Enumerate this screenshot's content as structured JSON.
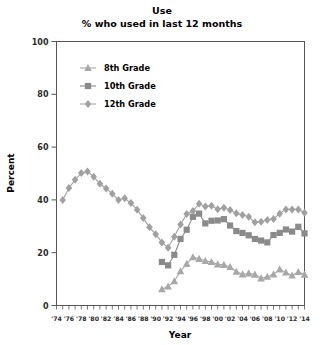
{
  "chart_data": {
    "type": "line",
    "title": "Use",
    "subtitle": "% who used in last 12 months",
    "xlabel": "Year",
    "ylabel": "Percent",
    "ylim": [
      0,
      100
    ],
    "yticks": [
      0,
      20,
      40,
      60,
      80,
      100
    ],
    "xlim": [
      1974,
      2014
    ],
    "xticks_labeled": [
      "'74",
      "'76",
      "'78",
      "'80",
      "'82",
      "'84",
      "'86",
      "'88",
      "'90",
      "'92",
      "'94",
      "'96",
      "'98",
      "'00",
      "'02",
      "'04",
      "'06",
      "'08",
      "'10",
      "'12",
      "'14"
    ],
    "xticks_labeled_values": [
      1974,
      1976,
      1978,
      1980,
      1982,
      1984,
      1986,
      1988,
      1990,
      1992,
      1994,
      1996,
      1998,
      2000,
      2002,
      2004,
      2006,
      2008,
      2010,
      2012,
      2014
    ],
    "grid": false,
    "legend_position": "upper-left-inside",
    "series": [
      {
        "name": "8th Grade",
        "marker": "triangle",
        "color": "#a8a8a8",
        "x": [
          1991,
          1992,
          1993,
          1994,
          1995,
          1996,
          1997,
          1998,
          1999,
          2000,
          2001,
          2002,
          2003,
          2004,
          2005,
          2006,
          2007,
          2008,
          2009,
          2010,
          2011,
          2012,
          2013,
          2014
        ],
        "values": [
          6.2,
          7.2,
          9.2,
          13.0,
          15.8,
          18.3,
          17.7,
          16.9,
          16.5,
          15.6,
          15.4,
          14.6,
          12.8,
          11.8,
          12.2,
          11.7,
          10.3,
          10.9,
          11.8,
          13.7,
          12.5,
          11.4,
          12.7,
          11.7
        ]
      },
      {
        "name": "10th Grade",
        "marker": "square",
        "color": "#8a8a8a",
        "x": [
          1991,
          1992,
          1993,
          1994,
          1995,
          1996,
          1997,
          1998,
          1999,
          2000,
          2001,
          2002,
          2003,
          2004,
          2005,
          2006,
          2007,
          2008,
          2009,
          2010,
          2011,
          2012,
          2013,
          2014
        ],
        "values": [
          16.5,
          15.2,
          19.2,
          25.2,
          28.7,
          33.6,
          34.8,
          31.1,
          32.1,
          32.2,
          32.7,
          30.3,
          28.2,
          27.5,
          26.6,
          25.2,
          24.6,
          23.9,
          26.7,
          27.5,
          28.8,
          28.0,
          29.8,
          27.3
        ]
      },
      {
        "name": "12th Grade",
        "marker": "diamond",
        "color": "#a0a0a0",
        "x": [
          1975,
          1976,
          1977,
          1978,
          1979,
          1980,
          1981,
          1982,
          1983,
          1984,
          1985,
          1986,
          1987,
          1988,
          1989,
          1990,
          1991,
          1992,
          1993,
          1994,
          1995,
          1996,
          1997,
          1998,
          1999,
          2000,
          2001,
          2002,
          2003,
          2004,
          2005,
          2006,
          2007,
          2008,
          2009,
          2010,
          2011,
          2012,
          2013,
          2014
        ],
        "values": [
          40.0,
          44.5,
          47.6,
          50.2,
          50.8,
          48.8,
          46.1,
          44.3,
          42.3,
          40.0,
          40.6,
          38.8,
          36.3,
          33.1,
          29.6,
          27.0,
          23.9,
          21.9,
          26.0,
          30.7,
          34.7,
          35.8,
          38.5,
          37.5,
          37.8,
          36.5,
          37.0,
          36.2,
          34.9,
          34.3,
          33.6,
          31.5,
          31.7,
          32.4,
          32.8,
          34.8,
          36.4,
          36.4,
          36.4,
          35.1
        ]
      }
    ]
  },
  "legend": {
    "items": [
      {
        "label": "8th Grade"
      },
      {
        "label": "10th Grade"
      },
      {
        "label": "12th Grade"
      }
    ]
  }
}
